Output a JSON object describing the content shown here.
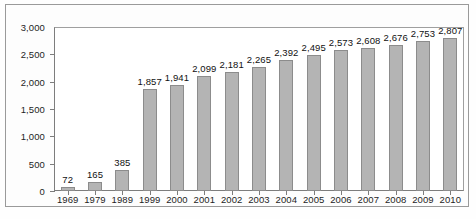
{
  "chart_data": {
    "type": "bar",
    "title": "",
    "subtitle": "",
    "xlabel": "",
    "ylabel": "",
    "categories": [
      "1969",
      "1979",
      "1989",
      "1999",
      "2000",
      "2001",
      "2002",
      "2003",
      "2004",
      "2005",
      "2006",
      "2007",
      "2008",
      "2009",
      "2010"
    ],
    "values": [
      72,
      165,
      385,
      1857,
      1941,
      2099,
      2181,
      2265,
      2392,
      2495,
      2573,
      2608,
      2676,
      2753,
      2807
    ],
    "value_labels": [
      "72",
      "165",
      "385",
      "1,857",
      "1,941",
      "2,099",
      "2,181",
      "2,265",
      "2,392",
      "2,495",
      "2,573",
      "2,608",
      "2,676",
      "2,753",
      "2,807"
    ],
    "ylim": [
      0,
      3000
    ],
    "ytick_values": [
      0,
      500,
      1000,
      1500,
      2000,
      2500,
      3000
    ],
    "ytick_labels": [
      "0",
      "500",
      "1,000",
      "1,500",
      "2,000",
      "2,500",
      "3,000"
    ],
    "grid": false,
    "legend": null,
    "legend_position": "none",
    "bar_color": "#b4b4b4",
    "bar_border_color": "#8c8c8c",
    "axis_color": "#7d7d7d",
    "text_color": "#1d1d1d",
    "background_color": "#ffffff",
    "frame_color": "#9a9a9a"
  }
}
